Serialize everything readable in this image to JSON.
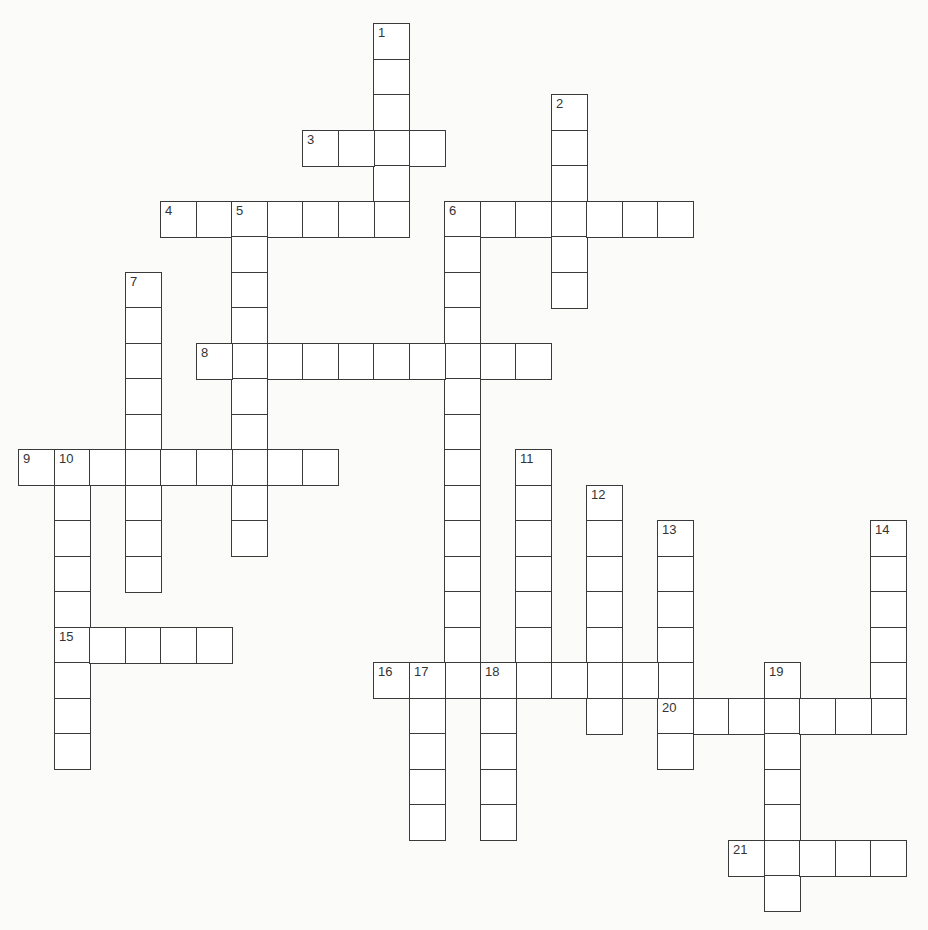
{
  "puzzle": {
    "type": "crossword",
    "grid": {
      "origin_x": 18,
      "origin_y": 23,
      "cell_pitch": 35.5,
      "columns": 25,
      "rows": 25,
      "line_color": "#3a3a3a",
      "background": "#fbfbfa",
      "cell_fill": "#ffffff"
    },
    "entries": [
      {
        "number": 1,
        "direction": "down",
        "row": 0,
        "col": 10,
        "length": 6,
        "answer": ""
      },
      {
        "number": 2,
        "direction": "down",
        "row": 2,
        "col": 15,
        "length": 6,
        "answer": ""
      },
      {
        "number": 3,
        "direction": "across",
        "row": 3,
        "col": 8,
        "length": 4,
        "answer": ""
      },
      {
        "number": 4,
        "direction": "across",
        "row": 5,
        "col": 4,
        "length": 7,
        "answer": ""
      },
      {
        "number": 5,
        "direction": "down",
        "row": 5,
        "col": 6,
        "length": 10,
        "answer": ""
      },
      {
        "number": 6,
        "direction": "across",
        "row": 5,
        "col": 12,
        "length": 7,
        "answer": ""
      },
      {
        "number": 6,
        "direction": "down",
        "row": 5,
        "col": 12,
        "length": 14,
        "answer": ""
      },
      {
        "number": 7,
        "direction": "down",
        "row": 7,
        "col": 3,
        "length": 9,
        "answer": ""
      },
      {
        "number": 8,
        "direction": "across",
        "row": 9,
        "col": 5,
        "length": 10,
        "answer": ""
      },
      {
        "number": 9,
        "direction": "across",
        "row": 12,
        "col": 0,
        "length": 9,
        "answer": ""
      },
      {
        "number": 10,
        "direction": "down",
        "row": 12,
        "col": 1,
        "length": 9,
        "answer": ""
      },
      {
        "number": 11,
        "direction": "down",
        "row": 12,
        "col": 14,
        "length": 7,
        "answer": ""
      },
      {
        "number": 12,
        "direction": "down",
        "row": 13,
        "col": 16,
        "length": 7,
        "answer": ""
      },
      {
        "number": 13,
        "direction": "down",
        "row": 14,
        "col": 18,
        "length": 7,
        "answer": ""
      },
      {
        "number": 14,
        "direction": "down",
        "row": 14,
        "col": 24,
        "length": 6,
        "answer": ""
      },
      {
        "number": 15,
        "direction": "across",
        "row": 17,
        "col": 1,
        "length": 5,
        "answer": ""
      },
      {
        "number": 16,
        "direction": "across",
        "row": 18,
        "col": 10,
        "length": 9,
        "answer": ""
      },
      {
        "number": 17,
        "direction": "down",
        "row": 18,
        "col": 11,
        "length": 5,
        "answer": ""
      },
      {
        "number": 18,
        "direction": "down",
        "row": 18,
        "col": 13,
        "length": 5,
        "answer": ""
      },
      {
        "number": 19,
        "direction": "down",
        "row": 18,
        "col": 21,
        "length": 7,
        "answer": ""
      },
      {
        "number": 20,
        "direction": "across",
        "row": 19,
        "col": 18,
        "length": 7,
        "answer": ""
      },
      {
        "number": 21,
        "direction": "across",
        "row": 23,
        "col": 20,
        "length": 5,
        "answer": ""
      }
    ]
  }
}
